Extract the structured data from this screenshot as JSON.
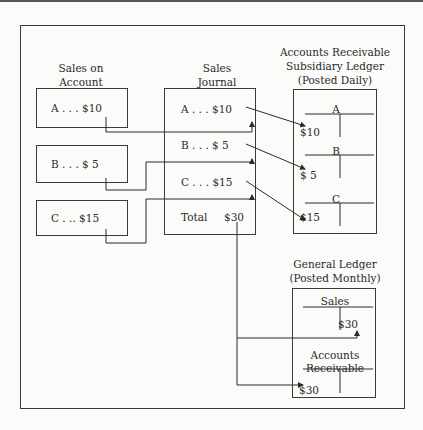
{
  "diagram": {
    "sales_on_account": {
      "title_line1": "Sales on",
      "title_line2": "Account",
      "entries": [
        {
          "label": "A . . . $10"
        },
        {
          "label": "B . . . $ 5"
        },
        {
          "label": "C . .. $15"
        }
      ]
    },
    "sales_journal": {
      "title_line1": "Sales",
      "title_line2": "Journal",
      "entries": [
        {
          "label": "A . . . $10"
        },
        {
          "label": "B . . . $ 5"
        },
        {
          "label": "C . . . $15"
        }
      ],
      "total_label": "Total",
      "total_value": "$30"
    },
    "subsidiary_ledger": {
      "title_line1": "Accounts Receivable",
      "title_line2": "Subsidiary Ledger",
      "title_line3": "(Posted Daily)",
      "accounts": [
        {
          "name": "A",
          "debit": "$10"
        },
        {
          "name": "B",
          "debit": "$ 5"
        },
        {
          "name": "C",
          "debit": "$15"
        }
      ]
    },
    "general_ledger": {
      "title_line1": "General Ledger",
      "title_line2": "(Posted Monthly)",
      "sales": {
        "name": "Sales",
        "credit": "$30"
      },
      "accounts_receivable": {
        "name_line1": "Accounts",
        "name_line2": "Receivable",
        "debit": "$30"
      }
    }
  }
}
